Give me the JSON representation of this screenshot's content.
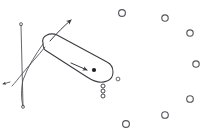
{
  "figure": {
    "title": "Schematic line drawing: elongated capsule body with directional arrows among scattered ring markers",
    "width": 213,
    "height": 136,
    "background_color": "#ffffff",
    "line_color": "#3a3a42",
    "marker_color": "#55555e",
    "dot_color": "#1d1d22"
  },
  "chart_data": {
    "type": "scatter",
    "xlabel": "",
    "ylabel": "",
    "xlim": [
      0,
      213
    ],
    "ylim": [
      0,
      136
    ],
    "grid": false,
    "legend": "none",
    "series": [
      {
        "name": "ring-markers",
        "marker": "open-circle",
        "points": [
          {
            "x": 122,
            "y": 13,
            "r": 3.4
          },
          {
            "x": 165,
            "y": 18,
            "r": 3.2
          },
          {
            "x": 190,
            "y": 33,
            "r": 3.2
          },
          {
            "x": 196,
            "y": 64,
            "r": 3.2
          },
          {
            "x": 190,
            "y": 99,
            "r": 3.3
          },
          {
            "x": 165,
            "y": 115,
            "r": 3.3
          },
          {
            "x": 126,
            "y": 124,
            "r": 3.4
          }
        ]
      },
      {
        "name": "small-ring-marker",
        "marker": "open-circle",
        "points": [
          {
            "x": 118,
            "y": 79,
            "r": 1.9
          }
        ]
      },
      {
        "name": "capsule-interior-dot",
        "marker": "filled-dot",
        "points": [
          {
            "x": 94,
            "y": 70,
            "r": 2.1
          }
        ]
      }
    ]
  },
  "elements": {
    "capsule": {
      "label": "elongated-capsule-body",
      "path": "M 42,44 C 40,37 49,33 56,35 L 106,62 C 114,66 114,78 106,81 C 99,84 92,80 86,76 L 44,50 C 42,48 42,46 42,44 Z"
    },
    "interior_arrow": {
      "label": "interior-direction-arrow",
      "from": {
        "x": 70,
        "y": 63
      },
      "to": {
        "x": 88,
        "y": 70
      },
      "direction": "right"
    },
    "up_right_arrow": {
      "label": "upper-right-pointing-arrow",
      "from": {
        "x": 51,
        "y": 40
      },
      "to": {
        "x": 74,
        "y": 18
      },
      "direction": "up-right"
    },
    "vertical_double_arrow": {
      "label": "vertical-double-headed-arrow",
      "from": {
        "x": 21,
        "y": 24
      },
      "to": {
        "x": 23,
        "y": 107
      }
    },
    "left_arrow": {
      "label": "left-pointing-arrow",
      "from": {
        "x": 10,
        "y": 82
      },
      "to": {
        "x": 1,
        "y": 84
      },
      "direction": "left"
    },
    "fork_curves": {
      "label": "forked-curve-pair",
      "curve_a": "M 42,44 C 34,54 27,68 22,84 C 20,92 20,100 22,106",
      "curve_b": "M 44,46 C 36,56 28,66 20,76 C 16,80 14,84 13,87"
    },
    "ring_stack": {
      "label": "vertical-ring-stack",
      "x": 103,
      "rings": [
        {
          "cy": 86,
          "r": 2.0
        },
        {
          "cy": 91,
          "r": 2.0
        },
        {
          "cy": 96,
          "r": 2.0
        }
      ]
    }
  }
}
